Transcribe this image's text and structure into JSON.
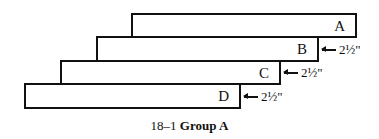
{
  "figure": {
    "caption_number": "18–1",
    "caption_title": "Group A"
  },
  "boards": [
    {
      "label": "A",
      "left": 131,
      "top": 13,
      "right": 357,
      "bottom": 38
    },
    {
      "label": "B",
      "left": 96,
      "top": 36,
      "right": 319,
      "bottom": 62
    },
    {
      "label": "C",
      "left": 60,
      "top": 60,
      "right": 281,
      "bottom": 85
    },
    {
      "label": "D",
      "left": 24,
      "top": 83,
      "right": 241,
      "bottom": 109
    }
  ],
  "dimensions": [
    {
      "text": "2½\"",
      "x": 321,
      "y": 49
    },
    {
      "text": "2½\"",
      "x": 283,
      "y": 72
    },
    {
      "text": "2½\"",
      "x": 243,
      "y": 96
    }
  ]
}
